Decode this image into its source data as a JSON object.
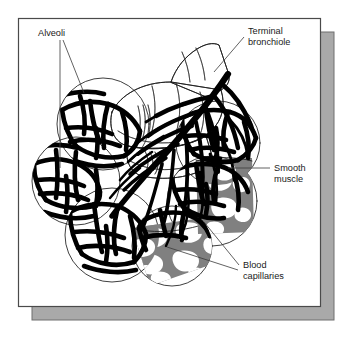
{
  "figure": {
    "kind": "anatomical-illustration",
    "frame": {
      "border_color": "#4a4a4a",
      "fill_color": "#ffffff",
      "shadow_color": "#a9a9a9",
      "shadow_edge_color": "#6f6f6f"
    },
    "palette": {
      "ink": "#000000",
      "outline": "#1c1c1c",
      "capillary_gray": "#808080",
      "label_text": "#1a1a1a",
      "leader_line": "#3a3a3a",
      "paper": "#ffffff"
    },
    "labels": [
      {
        "id": "alveoli",
        "name": "Alveoli",
        "lines": [
          "Alveoli"
        ],
        "text_anchor": "start",
        "x": 38,
        "y": 36,
        "leaders": [
          {
            "points": "60,40 60,168"
          },
          {
            "points": "63,40 84,93"
          }
        ]
      },
      {
        "id": "terminal-bronchiole",
        "name": "Terminal bronchiole",
        "lines": [
          "Terminal",
          "bronchiole"
        ],
        "text_anchor": "start",
        "x": 248,
        "y": 34,
        "leaders": [
          {
            "points": "244,37 214,72"
          }
        ]
      },
      {
        "id": "smooth-muscle",
        "name": "Smooth muscle",
        "lines": [
          "Smooth",
          "muscle"
        ],
        "text_anchor": "start",
        "x": 274,
        "y": 171,
        "leaders": [
          {
            "points": "270,168 228,168"
          }
        ]
      },
      {
        "id": "blood-capillaries",
        "name": "Blood capillaries",
        "lines": [
          "Blood",
          "capillaries"
        ],
        "text_anchor": "start",
        "x": 243,
        "y": 268,
        "leaders": [
          {
            "points": "239,265 204,222"
          },
          {
            "points": "238,270 167,247"
          }
        ]
      }
    ],
    "structures": [
      {
        "id": "alveolar-sac-upper-left",
        "name": "Alveolar sac (upper left)",
        "cx": 103,
        "cy": 124,
        "r": 46
      },
      {
        "id": "alveolar-sac-left",
        "name": "Alveolar sac (left)",
        "cx": 76,
        "cy": 181,
        "r": 44
      },
      {
        "id": "alveolar-sac-lower-left",
        "name": "Alveolar sac (lower left)",
        "cx": 112,
        "cy": 235,
        "r": 47
      },
      {
        "id": "alveolar-sac-lower-mid",
        "name": "Alveolar sac (lower middle)",
        "cx": 172,
        "cy": 246,
        "r": 40
      },
      {
        "id": "alveolar-sac-right",
        "name": "Alveolar sac (right)",
        "cx": 212,
        "cy": 201,
        "r": 45
      },
      {
        "id": "alveolar-sac-upper-right",
        "name": "Alveolar sac (upper right)",
        "cx": 218,
        "cy": 143,
        "r": 42
      },
      {
        "id": "terminal-bronchiole-tube",
        "name": "Terminal bronchiole tube"
      },
      {
        "id": "capillary-tree",
        "name": "Capillary branching tree"
      },
      {
        "id": "blood-capillary-cutaway-lower",
        "name": "Blood capillary cut-away (lower)"
      },
      {
        "id": "blood-capillary-cutaway-right",
        "name": "Blood capillary cut-away (right)"
      }
    ]
  }
}
